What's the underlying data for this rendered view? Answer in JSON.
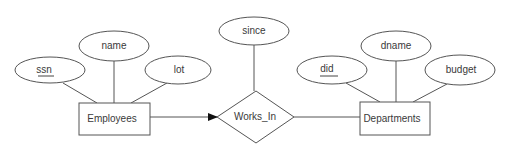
{
  "diagram": {
    "type": "ER diagram",
    "entities": [
      {
        "id": "employees",
        "label": "Employees"
      },
      {
        "id": "departments",
        "label": "Departments"
      }
    ],
    "relationships": [
      {
        "id": "works_in",
        "label": "Works_In"
      }
    ],
    "attributes": [
      {
        "id": "ssn",
        "label": "ssn",
        "key": true,
        "of": "employees"
      },
      {
        "id": "name",
        "label": "name",
        "key": false,
        "of": "employees"
      },
      {
        "id": "lot",
        "label": "lot",
        "key": false,
        "of": "employees"
      },
      {
        "id": "since",
        "label": "since",
        "key": false,
        "of": "works_in"
      },
      {
        "id": "did",
        "label": "did",
        "key": true,
        "of": "departments"
      },
      {
        "id": "dname",
        "label": "dname",
        "key": false,
        "of": "departments"
      },
      {
        "id": "budget",
        "label": "budget",
        "key": false,
        "of": "departments"
      }
    ],
    "edges": [
      {
        "from": "employees",
        "to": "works_in",
        "style": "arrow"
      },
      {
        "from": "works_in",
        "to": "departments",
        "style": "line"
      }
    ],
    "colors": {
      "stroke": "#555555",
      "text": "#3a3a3a",
      "background": "#ffffff"
    }
  }
}
